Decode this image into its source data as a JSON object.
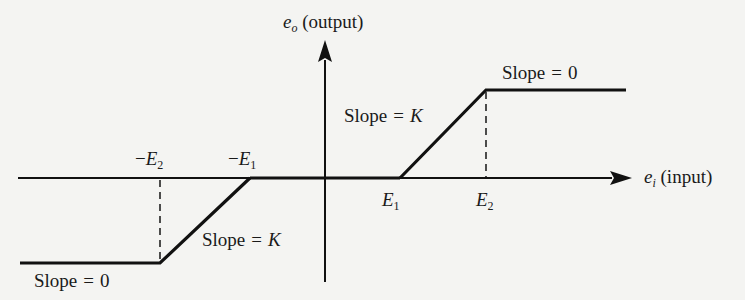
{
  "diagram": {
    "type": "dead-zone-with-saturation characteristic",
    "y_axis": {
      "symbol": "e",
      "subscript": "o",
      "label": "(output)"
    },
    "x_axis": {
      "symbol": "e",
      "subscript": "i",
      "label": "(input)"
    },
    "breakpoints": {
      "neg_E2": {
        "sign": "−",
        "symbol": "E",
        "subscript": "2"
      },
      "neg_E1": {
        "sign": "−",
        "symbol": "E",
        "subscript": "1"
      },
      "pos_E1": {
        "symbol": "E",
        "subscript": "1"
      },
      "pos_E2": {
        "symbol": "E",
        "subscript": "2"
      }
    },
    "slope_labels": {
      "upper_right_flat": {
        "word": "Slope",
        "eq": "=",
        "value": "0"
      },
      "upper_right_ramp": {
        "word": "Slope",
        "eq": "=",
        "value": "K"
      },
      "lower_left_ramp": {
        "word": "Slope",
        "eq": "=",
        "value": "K"
      },
      "lower_left_flat": {
        "word": "Slope",
        "eq": "=",
        "value": "0"
      }
    },
    "colors": {
      "line": "#111111",
      "background": "#f4f4f2"
    }
  }
}
